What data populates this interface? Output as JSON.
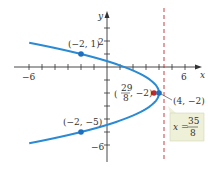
{
  "chart_data": {
    "type": "line",
    "title": "",
    "xlabel": "x",
    "ylabel": "y",
    "xlim": [
      -6.5,
      7
    ],
    "ylim": [
      -7,
      4.5
    ],
    "x_ticks": [
      -6,
      -5,
      -4,
      -3,
      -2,
      -1,
      1,
      2,
      3,
      4,
      5,
      6
    ],
    "y_ticks": [
      -6,
      -5,
      -4,
      -3,
      -2,
      -1,
      1,
      2,
      3
    ],
    "x_tick_labels": {
      "-6": "−6",
      "6": "6"
    },
    "y_tick_labels": {
      "2": "2",
      "-6": "−6"
    },
    "grid": false,
    "series": [
      {
        "name": "parabola",
        "equation": "(y+2)^2 = -1.5(x-4)",
        "color": "#2a8ad4",
        "y_range": [
          -5.87,
          1.87
        ]
      }
    ],
    "points": [
      {
        "label": "(−2, 1)",
        "x": -2,
        "y": 1,
        "color": "#1f6fbf"
      },
      {
        "label": "(−2, −5)",
        "x": -2,
        "y": -5,
        "color": "#1f6fbf"
      },
      {
        "label": "(4, −2)",
        "x": 4,
        "y": -2,
        "color": "#1f6fbf"
      },
      {
        "label": "(29/8, −2)",
        "x": 3.625,
        "y": -2,
        "color": "#c0282e"
      }
    ],
    "directrix": {
      "x": 4.375,
      "label_lhs": "x =",
      "label_num": "35",
      "label_den": "8",
      "color": "#c0282e"
    }
  },
  "labels": {
    "x_axis": "x",
    "y_axis": "y",
    "tick_neg6_x": "−6",
    "tick_6_x": "6",
    "tick_2_y": "2",
    "tick_neg6_y": "−6",
    "pt_a": "(−2, 1)",
    "pt_b": "(−2, −5)",
    "vertex": "(4, −2)",
    "focus_num": "29",
    "focus_den": "8",
    "focus_rest": ", −2)",
    "focus_open": "(",
    "directrix_lhs": "x =",
    "directrix_num": "35",
    "directrix_den": "8"
  }
}
